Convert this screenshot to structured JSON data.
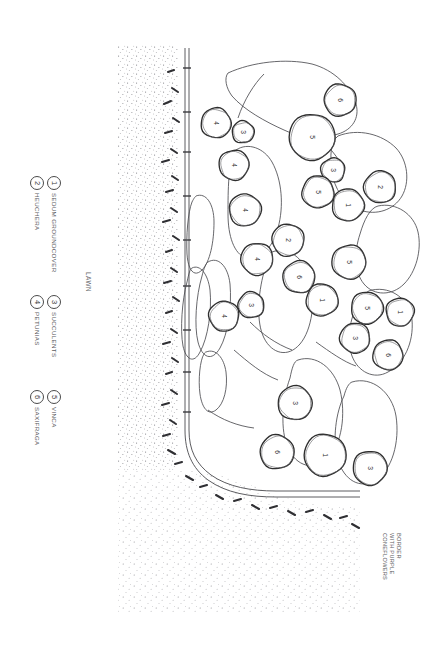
{
  "sheet": {
    "width": 442,
    "height": 650,
    "background": "#ffffff",
    "ink": "#2e2e2e",
    "texture_ink": "#6f6f73"
  },
  "labels": {
    "lawn": "LAWN",
    "border_note_lines": [
      "BORDER",
      "WITH PURPLE",
      "CONEFLOWERS"
    ]
  },
  "legend": {
    "items": [
      {
        "key": "1",
        "label": "SEDUM GROUNDCOVER"
      },
      {
        "key": "2",
        "label": "HEUCHERA"
      },
      {
        "key": "3",
        "label": "SUCCULENTS"
      },
      {
        "key": "4",
        "label": "PETUNIAS"
      },
      {
        "key": "5",
        "label": "VINCA"
      },
      {
        "key": "6",
        "label": "SAXIFRAGA"
      }
    ]
  },
  "chart_data": {
    "type": "diagram",
    "subtype": "landscape-planting-plan",
    "legend_position": "left",
    "plant_key": {
      "1": "SEDUM GROUNDCOVER",
      "2": "HEUCHERA",
      "3": "SUCCULENTS",
      "4": "PETUNIAS",
      "5": "VINCA",
      "6": "SAXIFRAGA"
    },
    "plantings": [
      {
        "key": "4",
        "cx": 216,
        "cy": 123,
        "r": 15
      },
      {
        "key": "3",
        "cx": 243,
        "cy": 132,
        "r": 11
      },
      {
        "key": "6",
        "cx": 340,
        "cy": 100,
        "r": 16
      },
      {
        "key": "5",
        "cx": 312,
        "cy": 137,
        "r": 23
      },
      {
        "key": "4",
        "cx": 234,
        "cy": 165,
        "r": 15
      },
      {
        "key": "3",
        "cx": 333,
        "cy": 170,
        "r": 12
      },
      {
        "key": "2",
        "cx": 380,
        "cy": 187,
        "r": 16
      },
      {
        "key": "5",
        "cx": 318,
        "cy": 192,
        "r": 16
      },
      {
        "key": "1",
        "cx": 348,
        "cy": 205,
        "r": 16
      },
      {
        "key": "4",
        "cx": 245,
        "cy": 210,
        "r": 16
      },
      {
        "key": "2",
        "cx": 288,
        "cy": 240,
        "r": 16
      },
      {
        "key": "4",
        "cx": 257,
        "cy": 259,
        "r": 16
      },
      {
        "key": "5",
        "cx": 349,
        "cy": 262,
        "r": 17
      },
      {
        "key": "6",
        "cx": 299,
        "cy": 277,
        "r": 16
      },
      {
        "key": "3",
        "cx": 251,
        "cy": 305,
        "r": 13
      },
      {
        "key": "1",
        "cx": 322,
        "cy": 300,
        "r": 16
      },
      {
        "key": "5",
        "cx": 367,
        "cy": 308,
        "r": 16
      },
      {
        "key": "1",
        "cx": 400,
        "cy": 312,
        "r": 14
      },
      {
        "key": "4",
        "cx": 224,
        "cy": 316,
        "r": 15
      },
      {
        "key": "3",
        "cx": 355,
        "cy": 338,
        "r": 15
      },
      {
        "key": "6",
        "cx": 388,
        "cy": 355,
        "r": 15
      },
      {
        "key": "3",
        "cx": 295,
        "cy": 403,
        "r": 17
      },
      {
        "key": "6",
        "cx": 277,
        "cy": 452,
        "r": 17
      },
      {
        "key": "1",
        "cx": 325,
        "cy": 455,
        "r": 21
      },
      {
        "key": "3",
        "cx": 370,
        "cy": 468,
        "r": 17
      }
    ],
    "regions": [
      {
        "name": "lawn-stipple",
        "fill": "stipple",
        "description": "large stippled lawn area at left and lower-left"
      },
      {
        "name": "planting-bed",
        "fill": "none",
        "description": "irregular free-form bed outlines containing plant circles"
      },
      {
        "name": "edging-path",
        "fill": "none",
        "description": "double-line garden edging running vertically then curving right at bottom"
      },
      {
        "name": "mulch-dashes",
        "fill": "dashes",
        "description": "short dash marks along the edging representing mulch/border planting"
      }
    ]
  }
}
